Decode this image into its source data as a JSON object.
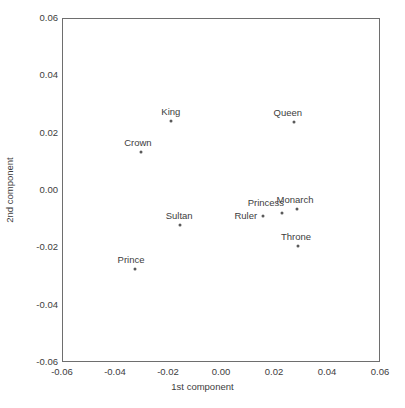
{
  "chart_data": {
    "type": "scatter",
    "title": "",
    "xlabel": "1st component",
    "ylabel": "2nd component",
    "xlim": [
      -0.06,
      0.06
    ],
    "ylim": [
      -0.06,
      0.06
    ],
    "xticks": [
      "-0.06",
      "-0.04",
      "-0.02",
      "0.00",
      "0.02",
      "0.04",
      "0.06"
    ],
    "xtick_values": [
      -0.06,
      -0.04,
      -0.02,
      0.0,
      0.02,
      0.04,
      0.06
    ],
    "yticks": [
      "0.06",
      "0.04",
      "0.02",
      "0.00",
      "-0.02",
      "-0.04",
      "-0.06"
    ],
    "ytick_values": [
      0.06,
      0.04,
      0.02,
      0.0,
      -0.02,
      -0.04,
      -0.06
    ],
    "grid": false,
    "legend": null,
    "marker_color": "#5a5a5a",
    "frame_color": "#6e6e6e",
    "text_color": "#3d3d3d",
    "points": [
      {
        "label": "King",
        "x": -0.0193,
        "y": 0.0244,
        "label_dx": 0,
        "label_dy": -5
      },
      {
        "label": "Crown",
        "x": -0.0306,
        "y": 0.0136,
        "label_dx": -3,
        "label_dy": -5
      },
      {
        "label": "Queen",
        "x": 0.0271,
        "y": 0.024,
        "label_dx": -6,
        "label_dy": -5
      },
      {
        "label": "Monarch",
        "x": 0.0283,
        "y": -0.0063,
        "label_dx": -2,
        "label_dy": -5
      },
      {
        "label": "Princess",
        "x": 0.0226,
        "y": -0.0077,
        "label_dx": -16,
        "label_dy": -6
      },
      {
        "label": "Ruler",
        "x": 0.0154,
        "y": -0.0087,
        "label_dx": -17,
        "label_dy": 4
      },
      {
        "label": "Sultan",
        "x": -0.0158,
        "y": -0.0119,
        "label_dx": -1,
        "label_dy": -5
      },
      {
        "label": "Throne",
        "x": 0.0287,
        "y": -0.0192,
        "label_dx": -2,
        "label_dy": -5
      },
      {
        "label": "Prince",
        "x": -0.0328,
        "y": -0.0272,
        "label_dx": -4,
        "label_dy": -5
      }
    ]
  }
}
